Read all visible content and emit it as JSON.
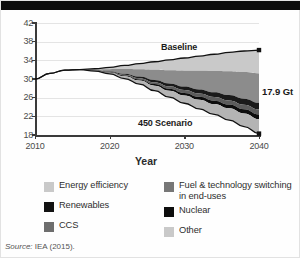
{
  "figure": {
    "source_prefix": "Source:",
    "source_text": "IEA (2015)."
  },
  "chart_data": {
    "type": "area",
    "title": "",
    "xlabel": "Year",
    "ylabel": "Gt CO2",
    "ylabel_main": "Gt CO",
    "ylabel_sub": "2",
    "xlim": [
      2010,
      2040
    ],
    "ylim": [
      18,
      42
    ],
    "yticks": [
      18,
      22,
      26,
      30,
      34,
      38,
      42
    ],
    "xticks": [
      2010,
      2020,
      2030,
      2040
    ],
    "grid": true,
    "legend_position": "below",
    "annotations": [
      {
        "name": "baseline-label",
        "text": "Baseline",
        "x": 2029,
        "y": 35.4
      },
      {
        "name": "scenario-label",
        "text": "450 Scenario",
        "x": 2026,
        "y": 22.6
      },
      {
        "name": "gap-label",
        "text": "17.9 Gt",
        "x": 2041,
        "y": 27.6
      }
    ],
    "series": [
      {
        "name": "Baseline",
        "x": [
          2010,
          2012,
          2014,
          2016,
          2018,
          2020,
          2022,
          2024,
          2026,
          2028,
          2030,
          2032,
          2034,
          2036,
          2038,
          2040
        ],
        "values": [
          30.0,
          31.2,
          31.9,
          32.0,
          32.2,
          32.5,
          32.9,
          33.3,
          33.7,
          34.1,
          34.5,
          34.9,
          35.3,
          35.7,
          36.0,
          36.2
        ]
      },
      {
        "name": "450 Scenario",
        "x": [
          2010,
          2012,
          2014,
          2016,
          2018,
          2020,
          2022,
          2024,
          2026,
          2028,
          2030,
          2032,
          2034,
          2036,
          2038,
          2040
        ],
        "values": [
          30.0,
          31.2,
          31.9,
          32.0,
          31.7,
          31.1,
          30.1,
          28.9,
          27.5,
          26.1,
          24.8,
          23.6,
          22.4,
          21.2,
          19.8,
          18.3
        ]
      }
    ],
    "wedges_2040": [
      {
        "name": "Energy efficiency",
        "top": 36.2,
        "bottom": 31.2,
        "color": "#c9c9c9"
      },
      {
        "name": "Fuel & technology switching in end-uses",
        "top": 31.2,
        "bottom": 24.9,
        "color": "#8c8c8c"
      },
      {
        "name": "Renewables",
        "top": 24.9,
        "bottom": 23.5,
        "color": "#1a1a1a"
      },
      {
        "name": "Nuclear",
        "top": 23.5,
        "bottom": 22.4,
        "color": "#5c5c5c"
      },
      {
        "name": "CCS",
        "top": 22.4,
        "bottom": 21.4,
        "color": "#0d0d0d"
      },
      {
        "name": "Other",
        "top": 21.4,
        "bottom": 18.3,
        "color": "#b4b4b4"
      }
    ]
  },
  "legend": {
    "columns": [
      {
        "items": [
          {
            "label": "Energy efficiency",
            "color": "#c9c9c9",
            "swatch_name": "swatch-energy-efficiency"
          },
          {
            "label": "Renewables",
            "color": "#121212",
            "swatch_name": "swatch-renewables"
          },
          {
            "label": "CCS",
            "color": "#6e6e6e",
            "swatch_name": "swatch-ccs"
          }
        ]
      },
      {
        "items": [
          {
            "label": "Fuel & technology switching in end-uses",
            "color": "#777777",
            "swatch_name": "swatch-fuel-technology-switching"
          },
          {
            "label": "Nuclear",
            "color": "#0d0d0d",
            "swatch_name": "swatch-nuclear"
          },
          {
            "label": "Other",
            "color": "#c9c9c9",
            "swatch_name": "swatch-other"
          }
        ]
      }
    ]
  }
}
